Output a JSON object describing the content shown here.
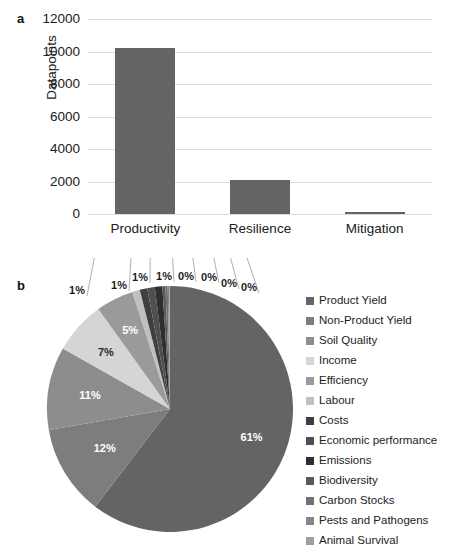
{
  "figure": {
    "panel_a_label": "a",
    "panel_b_label": "b"
  },
  "chart_data": [
    {
      "type": "bar",
      "panel": "a",
      "title": "",
      "xlabel": "",
      "ylabel": "Datapoints",
      "categories": [
        "Productivity",
        "Resilience",
        "Mitigation"
      ],
      "values": [
        10200,
        2100,
        60
      ],
      "ylim": [
        0,
        12000
      ],
      "yticks": [
        0,
        2000,
        4000,
        6000,
        8000,
        10000,
        12000
      ],
      "ytick_labels": [
        "0",
        "2000",
        "4000",
        "6000",
        "8000",
        "10000",
        "12000"
      ],
      "grid": true,
      "legend": "none",
      "bar_color": "#646464"
    },
    {
      "type": "pie",
      "panel": "b",
      "title": "",
      "legend_position": "right",
      "labels": [
        "Product Yield",
        "Non-Product Yield",
        "Soil Quality",
        "Income",
        "Efficiency",
        "Labour",
        "Costs",
        "Economic performance",
        "Emissions",
        "Biodiversity",
        "Carbon Stocks",
        "Pests and Pathogens",
        "Animal Survival"
      ],
      "values": [
        61,
        12,
        11,
        7,
        5,
        1,
        1,
        1,
        1,
        0,
        0,
        0,
        0
      ],
      "value_labels": [
        "61%",
        "12%",
        "11%",
        "7%",
        "5%",
        "1%",
        "1%",
        "1%",
        "1%",
        "0%",
        "0%",
        "0%",
        "0%"
      ],
      "colors": [
        "#646464",
        "#7d7d7d",
        "#8d8d8d",
        "#d5d5d5",
        "#9a9a9a",
        "#c0c0c0",
        "#3f3f3f",
        "#4f4f4f",
        "#2e2e2e",
        "#5a5a5a",
        "#707070",
        "#868686",
        "#9d9d9d"
      ]
    }
  ],
  "bar_chart": {
    "y_axis_title": "Datapoints",
    "yticks": [
      {
        "label": "12000"
      },
      {
        "label": "10000"
      },
      {
        "label": "8000"
      },
      {
        "label": "6000"
      },
      {
        "label": "4000"
      },
      {
        "label": "2000"
      },
      {
        "label": "0"
      }
    ],
    "xticks": [
      {
        "label": "Productivity"
      },
      {
        "label": "Resilience"
      },
      {
        "label": "Mitigation"
      }
    ]
  },
  "pie_chart": {
    "inside_labels": [
      {
        "label": "61%"
      },
      {
        "label": "12%"
      },
      {
        "label": "11%"
      },
      {
        "label": "7%"
      },
      {
        "label": "5%"
      }
    ],
    "outside_labels": [
      {
        "label": "1%"
      },
      {
        "label": "1%"
      },
      {
        "label": "1%"
      },
      {
        "label": "1%"
      },
      {
        "label": "0%"
      },
      {
        "label": "0%"
      },
      {
        "label": "0%"
      },
      {
        "label": "0%"
      }
    ]
  },
  "legend": {
    "items": [
      {
        "label": "Product Yield",
        "color": "#646464"
      },
      {
        "label": "Non-Product Yield",
        "color": "#7d7d7d"
      },
      {
        "label": "Soil Quality",
        "color": "#8d8d8d"
      },
      {
        "label": "Income",
        "color": "#d5d5d5"
      },
      {
        "label": "Efficiency",
        "color": "#9a9a9a"
      },
      {
        "label": "Labour",
        "color": "#c0c0c0"
      },
      {
        "label": "Costs",
        "color": "#3f3f3f"
      },
      {
        "label": "Economic performance",
        "color": "#4f4f4f"
      },
      {
        "label": "Emissions",
        "color": "#2e2e2e"
      },
      {
        "label": "Biodiversity",
        "color": "#5a5a5a"
      },
      {
        "label": "Carbon Stocks",
        "color": "#707070"
      },
      {
        "label": "Pests and Pathogens",
        "color": "#868686"
      },
      {
        "label": "Animal Survival",
        "color": "#9d9d9d"
      }
    ]
  }
}
